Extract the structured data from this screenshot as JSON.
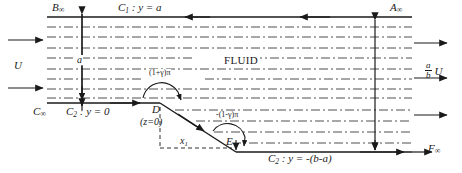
{
  "figure": {
    "background": "#ffffff",
    "line_color": "#1a1a1a",
    "stream_color": "#3a3a3a"
  },
  "labels": {
    "b_infinity": "B",
    "b_infinity_sub": "∞",
    "a_infinity": "A",
    "a_infinity_sub": "∞",
    "c_infinity": "C",
    "c_infinity_sub": "∞",
    "f_infinity": "F",
    "f_infinity_sub": "∞",
    "c1_boundary": "C",
    "c1_sub": "1",
    "c1_eq": " : y = a",
    "c2_top_boundary": "C",
    "c2_top_sub": "2",
    "c2_top_eq": " : y = 0",
    "c2_bottom_boundary": "C",
    "c2_bottom_sub": "2",
    "c2_bottom_eq": " : y = -(b-a)",
    "fluid": "FLUID",
    "velocity_left": "U",
    "velocity_right": "U",
    "velocity_ratio_num": "a",
    "velocity_ratio_den": "b",
    "height_a": "a",
    "point_d": "D",
    "point_d_note": "(z=0)",
    "point_e": "E",
    "distance_x1": "x",
    "distance_x1_sub": "1",
    "angle_upper": "(1+γ)π",
    "angle_lower": "-(1-γ)π"
  },
  "geometry": {
    "top_wall_y": 17,
    "mid_wall_y": 103,
    "bottom_wall_y": 153,
    "left_x": 47,
    "right_x": 415,
    "corner_d_x": 160,
    "corner_e_x": 236,
    "axis_left_x": 82,
    "axis_right_x": 375,
    "streamline_count": 12
  }
}
